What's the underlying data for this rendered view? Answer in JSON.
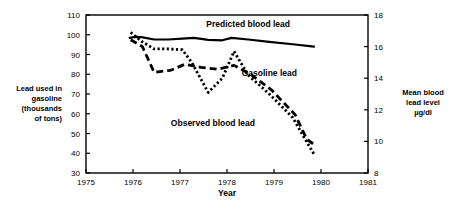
{
  "chart_data": {
    "type": "line",
    "title": "",
    "xlabel": "Year",
    "ylabel": "Lead used in gasoline (thousands of tons)",
    "y2label": "Mean blood lead level µg/dl",
    "xlim": [
      1975,
      1981
    ],
    "ylim": [
      30,
      110
    ],
    "y2lim": [
      8,
      18
    ],
    "xticks": [
      1975,
      1976,
      1977,
      1978,
      1979,
      1980,
      1981
    ],
    "yticks": [
      30,
      40,
      50,
      60,
      70,
      80,
      90,
      100,
      110
    ],
    "y2ticks": [
      8,
      10,
      12,
      14,
      16,
      18
    ],
    "grid": false,
    "legend": "inline-annotations",
    "series": [
      {
        "name": "Predicted blood lead",
        "axis": "right",
        "style": "solid",
        "x": [
          1975.93,
          1976.05,
          1976.18,
          1976.45,
          1976.75,
          1977.05,
          1977.3,
          1977.6,
          1977.9,
          1978.1,
          1978.45,
          1978.9,
          1979.4,
          1979.85
        ],
        "values": [
          16.55,
          16.62,
          16.6,
          16.45,
          16.45,
          16.5,
          16.55,
          16.42,
          16.4,
          16.55,
          16.45,
          16.3,
          16.15,
          16.0
        ],
        "values_left_scale": [
          97.6,
          98.2,
          98.0,
          96.8,
          96.8,
          97.2,
          97.6,
          96.5,
          96.4,
          97.6,
          96.8,
          95.6,
          94.4,
          93.5
        ]
      },
      {
        "name": "Observed blood lead",
        "axis": "right",
        "style": "dotted",
        "x": [
          1975.95,
          1976.2,
          1976.45,
          1976.75,
          1977.05,
          1977.25,
          1977.6,
          1977.9,
          1978.15,
          1978.45,
          1978.9,
          1979.4,
          1979.65,
          1979.85
        ],
        "values": [
          16.9,
          16.3,
          15.85,
          15.85,
          15.8,
          15.0,
          13.1,
          14.0,
          15.7,
          14.2,
          13.0,
          11.5,
          10.2,
          9.2
        ],
        "values_left_scale": [
          100.5,
          95.5,
          91.0,
          90.8,
          90.0,
          84.0,
          70.0,
          77.0,
          90.5,
          79.0,
          70.0,
          56.5,
          45.0,
          39.5
        ]
      },
      {
        "name": "Gasoline lead",
        "axis": "left",
        "style": "dashed",
        "x": [
          1975.95,
          1976.2,
          1976.45,
          1976.8,
          1977.1,
          1977.45,
          1977.8,
          1978.15,
          1978.5,
          1978.95,
          1979.45,
          1979.7,
          1979.85
        ],
        "values": [
          97.5,
          94.0,
          81.0,
          82.0,
          85.0,
          83.5,
          82.5,
          84.5,
          80.0,
          72.0,
          59.5,
          47.0,
          44.5
        ]
      }
    ],
    "annotations": [
      {
        "text": "Predicted blood lead",
        "x": 1978.45,
        "y_left": 104
      },
      {
        "text": "Gasoline lead",
        "x": 1978.9,
        "y_left": 79
      },
      {
        "text": "Observed blood lead",
        "x": 1977.7,
        "y_left": 54
      }
    ]
  },
  "axes": {
    "x_label": "Year",
    "x_ticks": [
      "1975",
      "1976",
      "1977",
      "1978",
      "1979",
      "1980",
      "1981"
    ],
    "y_left_ticks": [
      "110",
      "100",
      "90",
      "80",
      "70",
      "60",
      "50",
      "40",
      "30"
    ],
    "y_right_ticks": [
      "18",
      "16",
      "14",
      "12",
      "10",
      "8"
    ],
    "y_left_caption": [
      "Lead used in",
      "gasoline",
      "(thousands",
      "of tons)"
    ],
    "y_right_caption": [
      "Mean blood",
      "lead level",
      "µg/dl"
    ]
  },
  "labels": {
    "predicted": "Predicted blood lead",
    "gasoline": "Gasoline lead",
    "observed": "Observed blood lead"
  },
  "colors": {
    "ink": "#000000",
    "background": "#ffffff"
  }
}
